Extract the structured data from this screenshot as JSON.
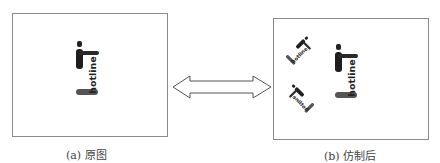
{
  "panels": {
    "left": {
      "caption": "(a) 原图",
      "logos": [
        {
          "text": "hotline",
          "size": "large",
          "rotation": 0
        }
      ]
    },
    "right": {
      "caption": "(b) 仿制后",
      "logos": [
        {
          "text": "hotline",
          "size": "large",
          "rotation": 0
        },
        {
          "text": "hotline",
          "size": "small",
          "rotation": -45
        },
        {
          "text": "hotline",
          "size": "small",
          "rotation": 45
        }
      ]
    }
  },
  "connector": {
    "type": "double-arrow",
    "icon": "double-arrow-icon"
  }
}
